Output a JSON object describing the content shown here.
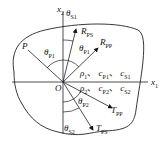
{
  "diagram": {
    "axes": {
      "x1": "x",
      "x1_sub": "1",
      "x2": "x",
      "x2_sub": "2",
      "origin": "O"
    },
    "point": "P",
    "incident_angle": {
      "sym": "θ",
      "sub": "P1"
    },
    "reflected": {
      "pp": {
        "sym": "R",
        "sub": "PP"
      },
      "ps": {
        "sym": "R",
        "sub": "PS"
      },
      "angle_p": {
        "sym": "θ",
        "sub": "P1"
      },
      "angle_s": {
        "sym": "θ",
        "sub": "S1"
      }
    },
    "transmitted": {
      "pp": {
        "sym": "T",
        "sub": "PP"
      },
      "ps": {
        "sym": "T",
        "sub": "PS"
      },
      "angle_p": {
        "sym": "θ",
        "sub": "P2"
      },
      "angle_s": {
        "sym": "θ",
        "sub": "S2"
      }
    },
    "medium1": {
      "rho": "ρ",
      "rho_sub": "1",
      "cp": "c",
      "cp_sub": "P1",
      "cs": "c",
      "cs_sub": "S1",
      "sep": "、"
    },
    "medium2": {
      "rho": "ρ",
      "rho_sub": "2",
      "cp": "c",
      "cp_sub": "P2",
      "cs": "c",
      "cs_sub": "S2",
      "sep": "、"
    }
  }
}
